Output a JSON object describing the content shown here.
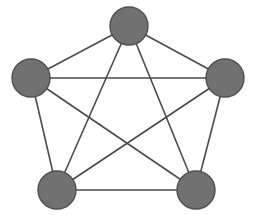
{
  "figure": {
    "name": "complete-graph-k5",
    "width": 256,
    "height": 215,
    "background_color": "#ffffff"
  },
  "style": {
    "node_fill_color": "#717171",
    "node_stroke_color": "#4e4e4e",
    "node_stroke_width": 1.4,
    "node_radius": 19,
    "edge_color": "#4b4b4b",
    "edge_width": 1.6
  },
  "chart_data": {
    "type": "diagram",
    "graph_type": "complete-graph",
    "vertex_count": 5,
    "edge_count": 10,
    "degree_per_vertex": 4,
    "layout": "regular-pentagon",
    "nodes": [
      {
        "id": "top",
        "label": "",
        "cx": 129,
        "cy": 26,
        "r": 19
      },
      {
        "id": "left",
        "label": "",
        "cx": 31,
        "cy": 78,
        "r": 19
      },
      {
        "id": "right",
        "label": "",
        "cx": 225,
        "cy": 78,
        "r": 19
      },
      {
        "id": "bottom-left",
        "label": "",
        "cx": 57,
        "cy": 190,
        "r": 19
      },
      {
        "id": "bottom-right",
        "label": "",
        "cx": 196,
        "cy": 190,
        "r": 19
      }
    ],
    "edges": [
      {
        "id": "top-left",
        "from": "top",
        "to": "left"
      },
      {
        "id": "top-right",
        "from": "top",
        "to": "right"
      },
      {
        "id": "top-bottom-left",
        "from": "top",
        "to": "bottom-left"
      },
      {
        "id": "top-bottom-right",
        "from": "top",
        "to": "bottom-right"
      },
      {
        "id": "left-right",
        "from": "left",
        "to": "right"
      },
      {
        "id": "left-bottom-left",
        "from": "left",
        "to": "bottom-left"
      },
      {
        "id": "left-bottom-right",
        "from": "left",
        "to": "bottom-right"
      },
      {
        "id": "right-bottom-left",
        "from": "right",
        "to": "bottom-left"
      },
      {
        "id": "right-bottom-right",
        "from": "right",
        "to": "bottom-right"
      },
      {
        "id": "bottom-left-bottom-right",
        "from": "bottom-left",
        "to": "bottom-right"
      }
    ]
  }
}
